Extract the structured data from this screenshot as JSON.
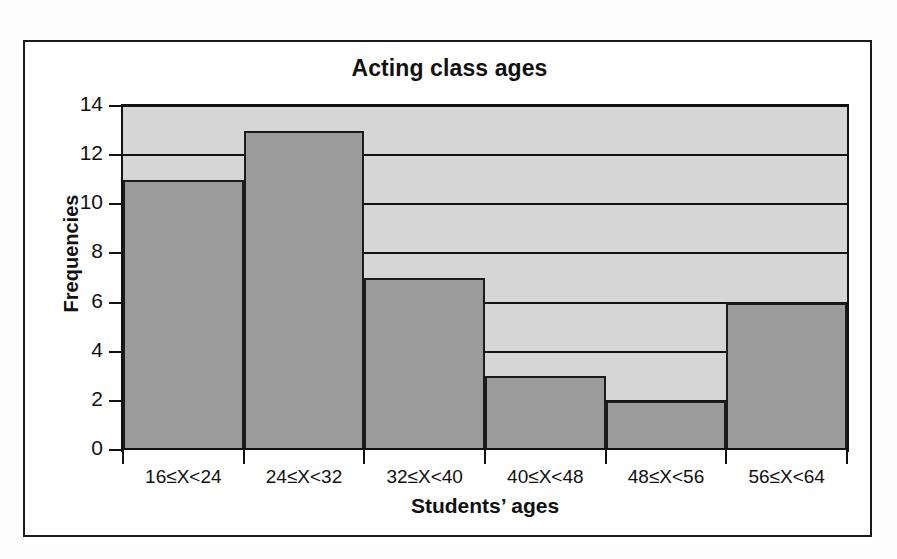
{
  "chart_data": {
    "type": "bar",
    "title": "Acting class ages",
    "xlabel": "Students’ ages",
    "ylabel": "Frequencies",
    "categories": [
      "16≤X<24",
      "24≤X<32",
      "32≤X<40",
      "40≤X<48",
      "48≤X<56",
      "56≤X<64"
    ],
    "values": [
      11,
      13,
      7,
      3,
      2,
      6
    ],
    "ylim": [
      0,
      14
    ],
    "ytick_labels": [
      "0",
      "2",
      "4",
      "6",
      "8",
      "10",
      "12",
      "14"
    ],
    "ytick_values": [
      0,
      2,
      4,
      6,
      8,
      10,
      12,
      14
    ],
    "grid": true,
    "grid_axis": "y",
    "legend": null,
    "bar_gap": 0,
    "colors": {
      "bar_fill": "#9b9b9b",
      "bar_border": "#1b1b1b",
      "plot_background": "#d6d6d6",
      "axis": "#121212",
      "gridline": "#121212",
      "text": "#111111",
      "frame": "#1a1a1a",
      "page_background": "#fdfdfd"
    }
  }
}
